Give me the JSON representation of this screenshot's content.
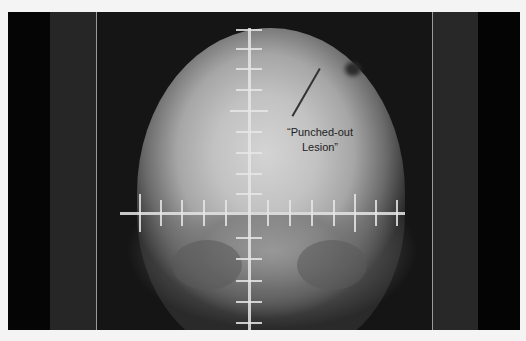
{
  "image": {
    "subject": "skull-xray-ap-view",
    "annotation": {
      "line1": "“Punched-out",
      "line2": "Lesion”"
    },
    "colors": {
      "background": "#f4f4f4",
      "film_dark": "#151515",
      "bone_light": "#d4d4d4",
      "crosshair": "#e6e6e6",
      "label_text": "#222222"
    },
    "crosshair": {
      "vertical_x": 249,
      "vertical_top": 28,
      "vertical_ticks_y": [
        30,
        49,
        69,
        90,
        111,
        132,
        153,
        174,
        194,
        238,
        259,
        281,
        302,
        323
      ],
      "horizontal_y": 213,
      "horizontal_left": 120,
      "horizontal_right": 405,
      "horizontal_ticks_x": [
        140,
        161,
        182,
        204,
        226,
        268,
        290,
        312,
        334,
        355,
        376,
        397
      ]
    }
  }
}
